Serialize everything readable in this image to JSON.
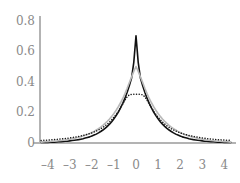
{
  "chart_data": {
    "type": "line",
    "title": "",
    "subtitle": "",
    "xlabel": "",
    "ylabel": "",
    "xlim": [
      -4.35,
      4.35
    ],
    "ylim": [
      0,
      0.83
    ],
    "grid": false,
    "legend": "none",
    "axis_color": "#b3b3b3",
    "tick_label_color": "#8a8a8a",
    "x_ticks": [
      {
        "value": -4,
        "label": "–4"
      },
      {
        "value": -3,
        "label": "–3"
      },
      {
        "value": -2,
        "label": "–2"
      },
      {
        "value": -1,
        "label": "–1"
      },
      {
        "value": 0,
        "label": "0"
      },
      {
        "value": 1,
        "label": "1"
      },
      {
        "value": 2,
        "label": "2"
      },
      {
        "value": 3,
        "label": "3"
      },
      {
        "value": 4,
        "label": "4"
      }
    ],
    "y_ticks": [
      {
        "value": 0,
        "label": "0"
      },
      {
        "value": 0.2,
        "label": "0.2"
      },
      {
        "value": 0.4,
        "label": "0.4"
      },
      {
        "value": 0.6,
        "label": "0.6"
      },
      {
        "value": 0.8,
        "label": "0.8"
      }
    ],
    "x": [
      -4.3,
      -4.2,
      -4.1,
      -4,
      -3.9,
      -3.8,
      -3.7,
      -3.6,
      -3.5,
      -3.4,
      -3.3,
      -3.2,
      -3.1,
      -3,
      -2.9,
      -2.8,
      -2.7,
      -2.6,
      -2.5,
      -2.4,
      -2.3,
      -2.2,
      -2.1,
      -2,
      -1.9,
      -1.8,
      -1.7,
      -1.6,
      -1.5,
      -1.4,
      -1.3,
      -1.2,
      -1.1,
      -1,
      -0.9,
      -0.8,
      -0.7,
      -0.6,
      -0.5,
      -0.4,
      -0.3,
      -0.2,
      -0.1,
      0,
      0.1,
      0.2,
      0.3,
      0.4,
      0.5,
      0.6,
      0.7,
      0.8,
      0.9,
      1,
      1.1,
      1.2,
      1.3,
      1.4,
      1.5,
      1.6,
      1.7,
      1.8,
      1.9,
      2,
      2.1,
      2.2,
      2.3,
      2.4,
      2.5,
      2.6,
      2.7,
      2.8,
      2.9,
      3,
      3.1,
      3.2,
      3.3,
      3.4,
      3.5,
      3.6,
      3.7,
      3.8,
      3.9,
      4,
      4.1,
      4.2,
      4.3
    ],
    "series": [
      {
        "name": "solid-black-curve",
        "style": "solid",
        "color": "#111111",
        "width": 1.6,
        "peak": 0.7,
        "values": [
          0.003,
          0.003,
          0.004,
          0.004,
          0.005,
          0.005,
          0.006,
          0.007,
          0.008,
          0.009,
          0.01,
          0.011,
          0.012,
          0.014,
          0.016,
          0.018,
          0.02,
          0.022,
          0.025,
          0.028,
          0.032,
          0.036,
          0.04,
          0.046,
          0.052,
          0.058,
          0.066,
          0.075,
          0.085,
          0.096,
          0.109,
          0.123,
          0.139,
          0.158,
          0.179,
          0.202,
          0.229,
          0.259,
          0.293,
          0.332,
          0.376,
          0.425,
          0.527,
          0.7,
          0.527,
          0.425,
          0.376,
          0.332,
          0.293,
          0.259,
          0.229,
          0.202,
          0.179,
          0.158,
          0.139,
          0.123,
          0.109,
          0.096,
          0.085,
          0.075,
          0.066,
          0.058,
          0.052,
          0.046,
          0.04,
          0.036,
          0.032,
          0.028,
          0.025,
          0.022,
          0.02,
          0.018,
          0.016,
          0.014,
          0.012,
          0.011,
          0.01,
          0.009,
          0.008,
          0.007,
          0.006,
          0.005,
          0.005,
          0.004,
          0.004,
          0.003,
          0.003
        ]
      },
      {
        "name": "solid-gray-curve",
        "style": "solid",
        "color": "#b9b9b9",
        "width": 1.6,
        "peak": 0.5,
        "values": [
          0.006,
          0.007,
          0.008,
          0.009,
          0.01,
          0.011,
          0.012,
          0.013,
          0.015,
          0.016,
          0.018,
          0.02,
          0.022,
          0.025,
          0.027,
          0.03,
          0.034,
          0.037,
          0.041,
          0.046,
          0.051,
          0.056,
          0.062,
          0.069,
          0.076,
          0.085,
          0.094,
          0.104,
          0.115,
          0.128,
          0.142,
          0.157,
          0.174,
          0.193,
          0.214,
          0.237,
          0.263,
          0.291,
          0.323,
          0.358,
          0.396,
          0.432,
          0.468,
          0.5,
          0.468,
          0.432,
          0.396,
          0.358,
          0.323,
          0.291,
          0.263,
          0.237,
          0.214,
          0.193,
          0.174,
          0.157,
          0.142,
          0.128,
          0.115,
          0.104,
          0.094,
          0.085,
          0.076,
          0.069,
          0.062,
          0.056,
          0.051,
          0.046,
          0.041,
          0.037,
          0.034,
          0.03,
          0.027,
          0.025,
          0.022,
          0.02,
          0.018,
          0.016,
          0.015,
          0.013,
          0.012,
          0.011,
          0.01,
          0.009,
          0.008,
          0.007,
          0.006
        ]
      },
      {
        "name": "dotted-black-curve",
        "style": "dotted",
        "color": "#1a1a1a",
        "width": 1.5,
        "peak": 0.318,
        "values": [
          0.017,
          0.018,
          0.018,
          0.019,
          0.02,
          0.021,
          0.022,
          0.023,
          0.025,
          0.026,
          0.028,
          0.029,
          0.031,
          0.033,
          0.035,
          0.038,
          0.04,
          0.043,
          0.046,
          0.049,
          0.053,
          0.057,
          0.061,
          0.066,
          0.072,
          0.078,
          0.085,
          0.093,
          0.102,
          0.112,
          0.124,
          0.137,
          0.152,
          0.169,
          0.187,
          0.208,
          0.231,
          0.255,
          0.28,
          0.302,
          0.315,
          0.318,
          0.318,
          0.318,
          0.318,
          0.318,
          0.315,
          0.302,
          0.28,
          0.255,
          0.231,
          0.208,
          0.187,
          0.169,
          0.152,
          0.137,
          0.124,
          0.112,
          0.102,
          0.093,
          0.085,
          0.078,
          0.072,
          0.066,
          0.061,
          0.057,
          0.053,
          0.049,
          0.046,
          0.043,
          0.04,
          0.038,
          0.035,
          0.033,
          0.031,
          0.029,
          0.028,
          0.026,
          0.025,
          0.023,
          0.022,
          0.021,
          0.02,
          0.019,
          0.018,
          0.018,
          0.017
        ]
      }
    ]
  }
}
